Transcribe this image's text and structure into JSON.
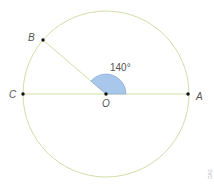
{
  "diagram": {
    "type": "circle-central-angle",
    "colors": {
      "circle": "#cfe0a6",
      "lines": "#cfe0a6",
      "angle_fill": "#a9c7ea",
      "angle_stroke": "#7fa3d1",
      "points": "#111111",
      "label": "#555555"
    },
    "points": {
      "A": {
        "label": "A"
      },
      "B": {
        "label": "B"
      },
      "C": {
        "label": "C"
      },
      "O": {
        "label": "O"
      }
    },
    "angle": {
      "label": "140°",
      "vertex": "O",
      "between": [
        "OA",
        "OB"
      ]
    },
    "watermark": "DAE"
  }
}
